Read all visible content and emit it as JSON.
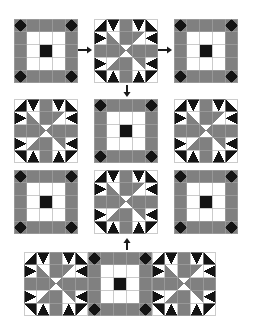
{
  "figure": {
    "canvas": {
      "width": 253,
      "height": 329
    },
    "background_color": "#ffffff"
  },
  "palette": {
    "dark": "#141414",
    "medium": "#808080",
    "light": "#ffffff",
    "line": "#a8a8a8",
    "arrow": "#1a1a1a"
  },
  "block_types": {
    "plain": {
      "name": "Square-in-Square Cross Block",
      "grid": 5,
      "description": "Five-by-five grid: square-in-square corner units, medium bar edges, white inner ring, dark center square"
    },
    "star": {
      "name": "Sawtooth Star Pinwheel Block",
      "grid": 5,
      "description": "Five-by-five grid: dark star points at corners and sides, medium and white pinwheel center"
    }
  },
  "blocks": [
    {
      "id": "r1c1",
      "type": "plain",
      "x": 14,
      "y": 19,
      "size": 64,
      "row": 1,
      "col": 1
    },
    {
      "id": "r1c2",
      "type": "star",
      "x": 94,
      "y": 19,
      "size": 64,
      "row": 1,
      "col": 2
    },
    {
      "id": "r1c3",
      "type": "plain",
      "x": 174,
      "y": 19,
      "size": 64,
      "row": 1,
      "col": 3
    },
    {
      "id": "r2c1",
      "type": "star",
      "x": 14,
      "y": 99,
      "size": 64,
      "row": 2,
      "col": 1
    },
    {
      "id": "r2c2",
      "type": "plain",
      "x": 94,
      "y": 99,
      "size": 64,
      "row": 2,
      "col": 2
    },
    {
      "id": "r2c3",
      "type": "star",
      "x": 174,
      "y": 99,
      "size": 64,
      "row": 2,
      "col": 3
    },
    {
      "id": "r3c1",
      "type": "plain",
      "x": 14,
      "y": 170,
      "size": 64,
      "row": 3,
      "col": 1
    },
    {
      "id": "r3c2",
      "type": "star",
      "x": 94,
      "y": 170,
      "size": 64,
      "row": 3,
      "col": 2
    },
    {
      "id": "r3c3",
      "type": "plain",
      "x": 174,
      "y": 170,
      "size": 64,
      "row": 3,
      "col": 3
    }
  ],
  "strip": {
    "id": "bottom-strip",
    "x": 24,
    "y": 252,
    "block_size": 64,
    "count": 3,
    "types": [
      "star",
      "plain",
      "star"
    ],
    "label": "Assembled three-block row"
  },
  "arrows": [
    {
      "id": "arrow-right-1",
      "direction": "right",
      "x": 78,
      "y": 45,
      "length": 14,
      "from": "r1c1",
      "to": "r1c2"
    },
    {
      "id": "arrow-right-2",
      "direction": "right",
      "x": 158,
      "y": 45,
      "length": 14,
      "from": "r1c2",
      "to": "r1c3"
    },
    {
      "id": "arrow-down-1",
      "direction": "down",
      "x": 122,
      "y": 85,
      "length": 12,
      "from": "r1c2",
      "to": "r2c2"
    },
    {
      "id": "arrow-up-1",
      "direction": "up",
      "x": 122,
      "y": 238,
      "length": 12,
      "from": "strip",
      "to": "r3c2"
    }
  ]
}
